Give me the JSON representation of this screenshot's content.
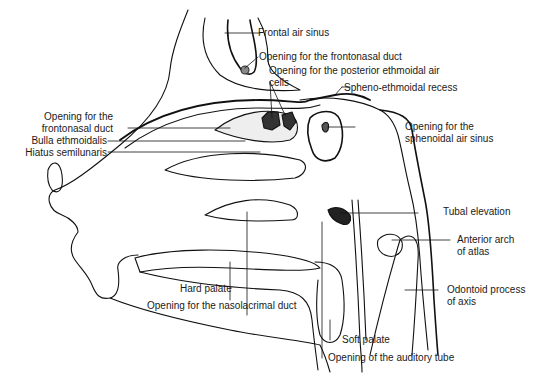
{
  "diagram": {
    "labels": {
      "frontal_air_sinus": "Frontal air sinus",
      "opening_frontonasal_duct_top": "Opening for the frontonasal duct",
      "opening_posterior_ethmoidal_1": "Opening for the posterior ethmoidal air",
      "opening_posterior_ethmoidal_2": "cells",
      "spheno_ethmoidal_recess": "Spheno-ethmoidal recess",
      "opening_frontonasal_left_1": "Opening for the",
      "opening_frontonasal_left_2": "frontonasal duct",
      "bulla_ethmoidalis": "Bulla ethmoidalis",
      "hiatus_semilunaris": "Hiatus semilunaris",
      "opening_sphenoidal_1": "Opening for the",
      "opening_sphenoidal_2": "sphenoidal air sinus",
      "tubal_elevation": "Tubal elevation",
      "anterior_arch_1": "Anterior arch",
      "anterior_arch_2": "of atlas",
      "hard_palate": "Hard palate",
      "opening_nasolacrimal": "Opening for the nasolacrimal duct",
      "odontoid_1": "Odontoid process",
      "odontoid_2": "of axis",
      "soft_palate": "Soft palate",
      "opening_auditory_tube": "Opening of the auditory tube"
    }
  }
}
